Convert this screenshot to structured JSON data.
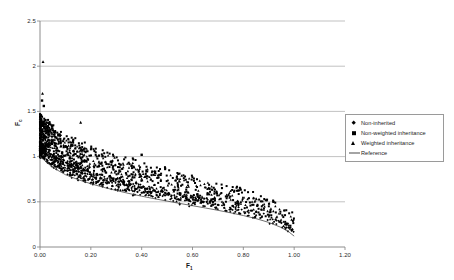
{
  "chart_data": {
    "type": "scatter",
    "title": "",
    "xlabel": "F",
    "xlabel_sub": "1",
    "ylabel": "F",
    "ylabel_sub": "c",
    "xlim": [
      0.0,
      1.2
    ],
    "ylim": [
      0.0,
      2.5
    ],
    "xticks": [
      "0.00",
      "0.20",
      "0.40",
      "0.60",
      "0.80",
      "1.00",
      "1.20"
    ],
    "xtick_values": [
      0.0,
      0.2,
      0.4,
      0.6,
      0.8,
      1.0,
      1.2
    ],
    "yticks": [
      "0",
      "0.5",
      "1",
      "1.5",
      "2",
      "2.5"
    ],
    "ytick_values": [
      0,
      0.5,
      1,
      1.5,
      2,
      2.5
    ],
    "grid": "horizontal",
    "grid_color": "#a8a8a8",
    "axis_color": "#808080",
    "legend_position": "right-upper",
    "legend": [
      {
        "label": "Non-inherited",
        "marker": "diamond",
        "color": "#000000"
      },
      {
        "label": "Non-weighted inheritance",
        "marker": "square",
        "color": "#000000"
      },
      {
        "label": "Weighted inheritance",
        "marker": "triangle",
        "color": "#000000"
      },
      {
        "label": "Reference",
        "marker": "line",
        "color": "#4a4a4a"
      }
    ],
    "series": [
      {
        "name": "Non-inherited",
        "marker": "diamond",
        "n_points": 620,
        "band": {
          "offset_low": 0.0,
          "offset_high": 0.16
        },
        "description": "Dense cloud hugging the reference curve from above, spreading from x=0 to x=1.0"
      },
      {
        "name": "Non-weighted inheritance",
        "marker": "square",
        "n_points": 620,
        "band": {
          "offset_low": 0.04,
          "offset_high": 0.48
        },
        "description": "Upper envelope of the cloud, reaching y=1.6 near x=0 and y=0.35 near x=1.0"
      },
      {
        "name": "Weighted inheritance",
        "marker": "triangle",
        "n_points": 520,
        "band": {
          "offset_low": 0.02,
          "offset_high": 0.42
        },
        "description": "Interleaved with squares; includes outlier near (0.01, 2.05)"
      }
    ],
    "reference_curve": {
      "name": "Reference",
      "color": "#4a4a4a",
      "points": [
        [
          0.0,
          1.0
        ],
        [
          0.05,
          0.88
        ],
        [
          0.1,
          0.8
        ],
        [
          0.15,
          0.745
        ],
        [
          0.2,
          0.7
        ],
        [
          0.25,
          0.66
        ],
        [
          0.3,
          0.625
        ],
        [
          0.35,
          0.592
        ],
        [
          0.4,
          0.562
        ],
        [
          0.45,
          0.534
        ],
        [
          0.5,
          0.508
        ],
        [
          0.55,
          0.482
        ],
        [
          0.6,
          0.457
        ],
        [
          0.65,
          0.432
        ],
        [
          0.7,
          0.406
        ],
        [
          0.75,
          0.378
        ],
        [
          0.8,
          0.348
        ],
        [
          0.85,
          0.314
        ],
        [
          0.9,
          0.272
        ],
        [
          0.95,
          0.215
        ],
        [
          0.98,
          0.165
        ],
        [
          1.0,
          0.12
        ]
      ]
    },
    "outliers": [
      {
        "x": 0.012,
        "y": 2.05,
        "marker": "triangle"
      },
      {
        "x": 0.01,
        "y": 1.7,
        "marker": "triangle"
      },
      {
        "x": 0.008,
        "y": 1.62,
        "marker": "square"
      },
      {
        "x": 0.015,
        "y": 1.56,
        "marker": "square"
      },
      {
        "x": 0.16,
        "y": 1.38,
        "marker": "triangle"
      },
      {
        "x": 0.4,
        "y": 1.02,
        "marker": "square"
      }
    ]
  }
}
